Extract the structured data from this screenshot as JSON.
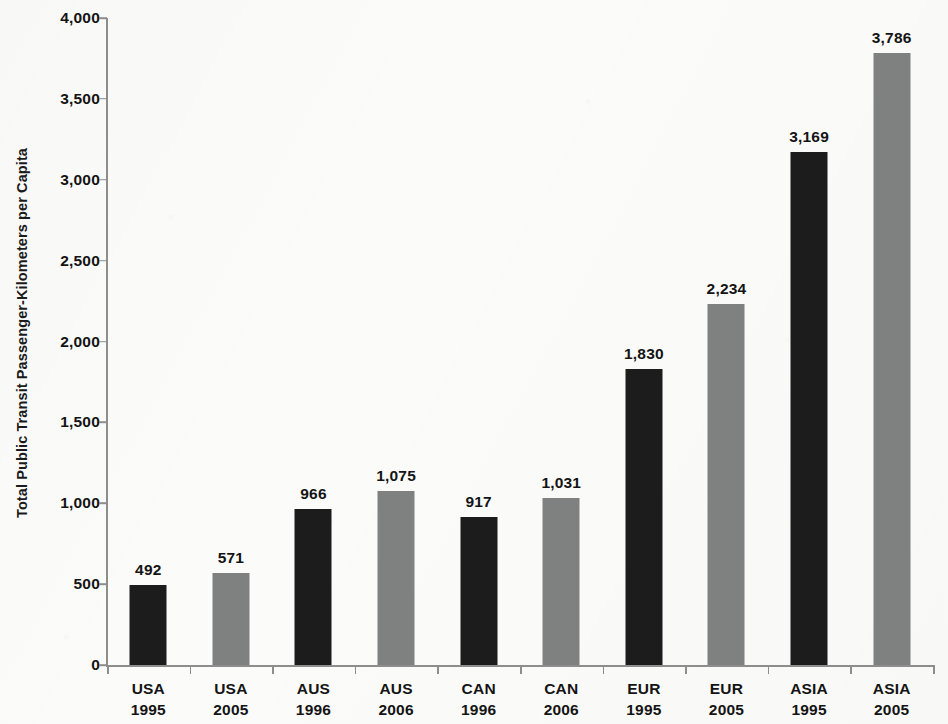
{
  "chart_data": {
    "type": "bar",
    "title": "",
    "xlabel": "",
    "ylabel": "Total Public Transit Passenger-Kilometers per Capita",
    "ylim": [
      0,
      4000
    ],
    "ytick_step": 500,
    "grid": false,
    "legend": "none",
    "categories": [
      {
        "region": "USA",
        "year": "1995",
        "label": "USA 1995"
      },
      {
        "region": "USA",
        "year": "2005",
        "label": "USA 2005"
      },
      {
        "region": "AUS",
        "year": "1996",
        "label": "AUS 1996"
      },
      {
        "region": "AUS",
        "year": "2006",
        "label": "AUS 2006"
      },
      {
        "region": "CAN",
        "year": "1996",
        "label": "CAN 1996"
      },
      {
        "region": "CAN",
        "year": "2006",
        "label": "CAN 2006"
      },
      {
        "region": "EUR",
        "year": "1995",
        "label": "EUR 1995"
      },
      {
        "region": "EUR",
        "year": "2005",
        "label": "EUR 2005"
      },
      {
        "region": "ASIA",
        "year": "1995",
        "label": "ASIA 1995"
      },
      {
        "region": "ASIA",
        "year": "2005",
        "label": "ASIA 2005"
      }
    ],
    "values": [
      492,
      571,
      966,
      1075,
      917,
      1031,
      1830,
      2234,
      3169,
      3786
    ],
    "value_labels": [
      "492",
      "571",
      "966",
      "1,075",
      "917",
      "1,031",
      "1,830",
      "2,234",
      "3,169",
      "3,786"
    ],
    "bar_colors": [
      "dark",
      "light",
      "dark",
      "light",
      "dark",
      "light",
      "dark",
      "light",
      "dark",
      "light"
    ],
    "ytick_labels": [
      "4,000",
      "3,500",
      "3,000",
      "2,500",
      "2,000",
      "1,500",
      "1,000",
      "500",
      "0"
    ],
    "ytick_values": [
      4000,
      3500,
      3000,
      2500,
      2000,
      1500,
      1000,
      500,
      0
    ],
    "colors": {
      "dark": "#1c1c1c",
      "light": "#7f8080",
      "axis": "#8d8d8d",
      "text": "#141414",
      "background": "#fbfbfa"
    }
  }
}
